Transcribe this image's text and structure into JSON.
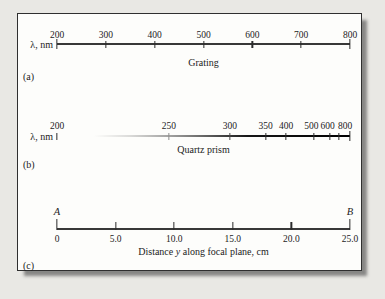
{
  "colors": {
    "page_background": "#e9e8e4",
    "card_background": "#fdfdfb",
    "frame_border": "#2f2f2f",
    "ink": "#1c1c1c"
  },
  "panel_a": {
    "axis_label": "λ, nm",
    "caption": "Grating",
    "panel_label": "(a)",
    "unit": "nm",
    "range": [
      200,
      800
    ],
    "ticks": [
      {
        "label": "200",
        "pos": 0,
        "end": true
      },
      {
        "label": "300",
        "pos": 16.67
      },
      {
        "label": "400",
        "pos": 33.33
      },
      {
        "label": "500",
        "pos": 50
      },
      {
        "label": "600",
        "pos": 66.67
      },
      {
        "label": "700",
        "pos": 83.33
      },
      {
        "label": "800",
        "pos": 100,
        "end": true
      }
    ]
  },
  "panel_b": {
    "axis_label": "λ, nm",
    "caption": "Quartz prism",
    "panel_label": "(b)",
    "unit": "nm",
    "range": [
      200,
      800
    ],
    "ticks": [
      {
        "label": "200",
        "pos": 0
      },
      {
        "label": "250",
        "pos": 38.2,
        "color": "#8f8f8f"
      },
      {
        "label": "300",
        "pos": 59.0,
        "color": "#4a4a4a"
      },
      {
        "label": "350",
        "pos": 71.2
      },
      {
        "label": "400",
        "pos": 78.2
      },
      {
        "label": "500",
        "pos": 87.7,
        "lpos": 86.8
      },
      {
        "label": "600",
        "pos": 93.2,
        "lpos": 92.4
      },
      {
        "label": "",
        "pos": 96.3
      },
      {
        "label": "800",
        "pos": 100,
        "end": true,
        "lpos": 98.3
      }
    ]
  },
  "panel_c": {
    "start_label": "A",
    "end_label": "B",
    "caption_pre": "Distance ",
    "caption_var": "y",
    "caption_post": " along focal plane, cm",
    "panel_label": "(c)",
    "unit": "cm",
    "range": [
      0,
      25
    ],
    "ticks": [
      {
        "label": "0",
        "pos": 0,
        "end": true
      },
      {
        "label": "5.0",
        "pos": 20
      },
      {
        "label": "10.0",
        "pos": 40
      },
      {
        "label": "15.0",
        "pos": 60
      },
      {
        "label": "20.0",
        "pos": 80
      },
      {
        "label": "25.0",
        "pos": 100,
        "end": true
      }
    ]
  }
}
